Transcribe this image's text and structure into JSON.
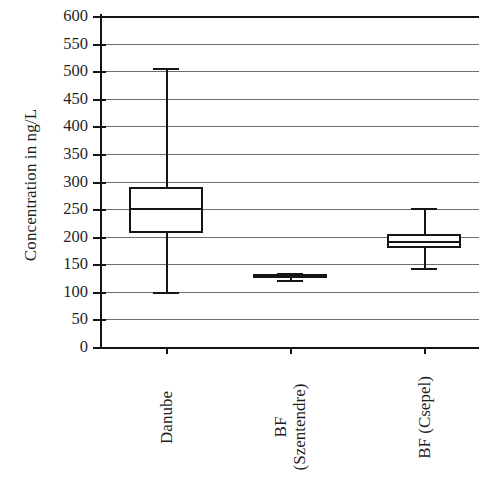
{
  "chart_data": {
    "type": "box",
    "title": "",
    "xlabel": "",
    "ylabel": "Concentration in ng/L",
    "ylim": [
      0,
      600
    ],
    "ytick_step": 50,
    "ytick_labels": [
      "600",
      "550",
      "500",
      "450",
      "400",
      "350",
      "300",
      "250",
      "200",
      "150",
      "100",
      "50",
      "0"
    ],
    "ytick_values": [
      600,
      550,
      500,
      450,
      400,
      350,
      300,
      250,
      200,
      150,
      100,
      50,
      0
    ],
    "grid": true,
    "grid_axis": "y",
    "legend": "none",
    "categories": [
      "Danube",
      "BF (Szentendre)",
      "BF (Csepel)"
    ],
    "boxes": [
      {
        "label": "Danube",
        "label_lines": [
          "Danube"
        ],
        "whisker_low": 100,
        "q1": 207,
        "median": 252,
        "q3": 290,
        "whisker_high": 506
      },
      {
        "label": "BF (Szentendre)",
        "label_lines": [
          "BF",
          "(Szentendre)"
        ],
        "whisker_low": 121,
        "q1": 128,
        "median": 130,
        "q3": 133,
        "whisker_high": 134
      },
      {
        "label": "BF (Csepel)",
        "label_lines": [
          "BF (Csepel)"
        ],
        "whisker_low": 143,
        "q1": 179,
        "median": 192,
        "q3": 205,
        "whisker_high": 252
      }
    ]
  },
  "axis": {
    "y_title": "Concentration in ng/L"
  },
  "colors": {
    "line": "#151515",
    "grid": "#6e6e6e",
    "background": "#ffffff"
  }
}
